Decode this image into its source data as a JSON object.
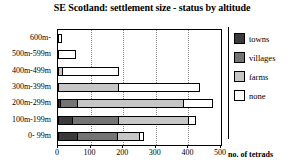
{
  "chart_data": {
    "type": "bar",
    "orientation": "horizontal",
    "stacked": true,
    "title": "SE Scotland: settlement size - status by altitude",
    "xlabel": "no. of tetrads",
    "ylabel": "",
    "xlim": [
      0,
      500
    ],
    "xticks": [
      0,
      100,
      200,
      300,
      400,
      500
    ],
    "grid": true,
    "legend_position": "right",
    "categories": [
      "600m-",
      "500m-599m",
      "400m-499m",
      "300m-399m",
      "200m-299m",
      "100m-199m",
      "0- 99m"
    ],
    "series": [
      {
        "name": "towns",
        "color": "#3a3a3a",
        "values": [
          0,
          0,
          0,
          0,
          10,
          46,
          61
        ]
      },
      {
        "name": "villages",
        "color": "#737373",
        "values": [
          0,
          0,
          0,
          0,
          55,
          144,
          126
        ]
      },
      {
        "name": "farms",
        "color": "#c6c6c6",
        "values": [
          0,
          0,
          15,
          187,
          327,
          218,
          71
        ]
      },
      {
        "name": "none",
        "color": "#ffffff",
        "values": [
          12,
          55,
          175,
          253,
          93,
          25,
          15
        ]
      }
    ],
    "totals": [
      12,
      55,
      190,
      440,
      485,
      433,
      273
    ]
  },
  "legend": {
    "items": [
      {
        "label": "towns",
        "color": "#3a3a3a"
      },
      {
        "label": "villages",
        "color": "#737373"
      },
      {
        "label": "farms",
        "color": "#c6c6c6"
      },
      {
        "label": "none",
        "color": "#ffffff"
      }
    ]
  },
  "axis": {
    "x_title": "no. of tetrads",
    "x_tick_labels": [
      "0",
      "100",
      "200",
      "300",
      "400",
      "500"
    ]
  }
}
